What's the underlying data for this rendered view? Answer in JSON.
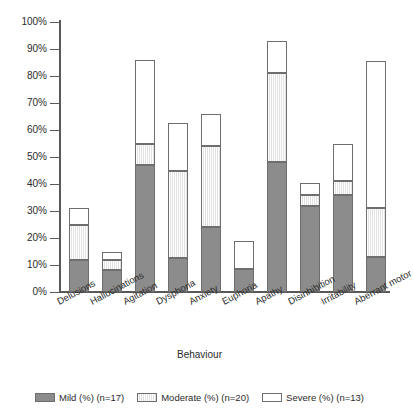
{
  "chart_data": {
    "type": "bar",
    "subtype": "stacked-bar",
    "title": "",
    "xlabel": "Behaviour",
    "ylabel": "",
    "ylim": [
      0,
      100
    ],
    "ytick_labels": [
      "0%",
      "10%",
      "20%",
      "30%",
      "40%",
      "50%",
      "60%",
      "70%",
      "80%",
      "90%",
      "100%"
    ],
    "ytick_values": [
      0,
      10,
      20,
      30,
      40,
      50,
      60,
      70,
      80,
      90,
      100
    ],
    "grid": false,
    "legend_position": "bottom",
    "categories": [
      "Delusions",
      "Hallucinations",
      "Agitation",
      "Dysphoria",
      "Anxiety",
      "Euphoria",
      "Apathy",
      "Disinhibition",
      "Irritability",
      "Aberrant motor"
    ],
    "series": [
      {
        "name": "Mild (%) (n=17)",
        "color": "#8c8c8c",
        "values": [
          12,
          8,
          47,
          12.5,
          24,
          8.5,
          48,
          32,
          36,
          13
        ]
      },
      {
        "name": "Moderate (%) (n=20)",
        "color": "#f0f0f0",
        "values": [
          13,
          4,
          8,
          32.5,
          30,
          0,
          33,
          4,
          5,
          18
        ]
      },
      {
        "name": "Severe (%) (n=13)",
        "color": "#ffffff",
        "values": [
          6,
          3,
          31,
          17.5,
          12,
          10.5,
          12,
          4.5,
          14,
          54.5
        ]
      }
    ],
    "cumulative_tops": [
      [
        12,
        25,
        31
      ],
      [
        8,
        12,
        15
      ],
      [
        47,
        55,
        86
      ],
      [
        12.5,
        45,
        62.5
      ],
      [
        24,
        54,
        66
      ],
      [
        8.5,
        8.5,
        19
      ],
      [
        48,
        81,
        93
      ],
      [
        32,
        36,
        40.5
      ],
      [
        36,
        41,
        55
      ],
      [
        13,
        31,
        85.5
      ]
    ]
  },
  "legend": {
    "items": [
      {
        "label": "Mild (%) (n=17)"
      },
      {
        "label": "Moderate (%) (n=20)"
      },
      {
        "label": "Severe (%) (n=13)"
      }
    ]
  }
}
